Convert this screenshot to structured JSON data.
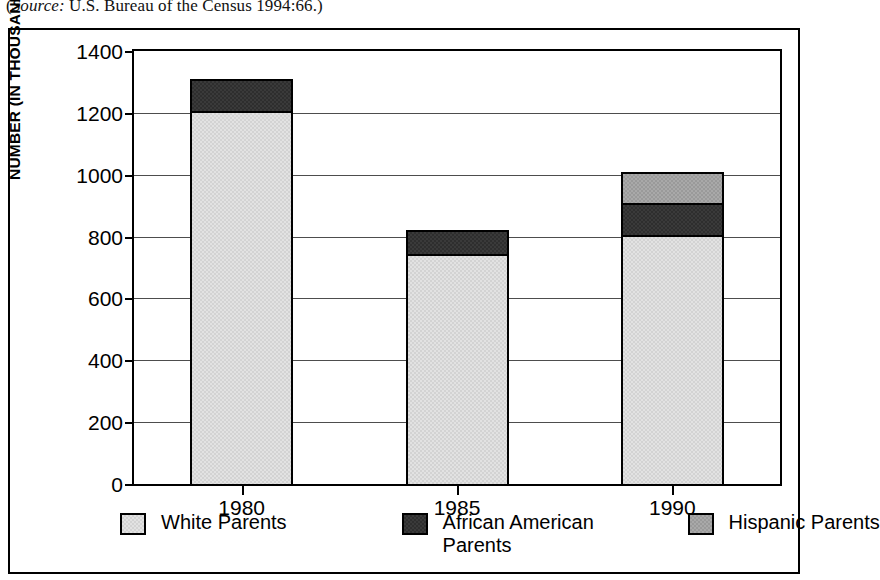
{
  "source_note": {
    "prefix": "(",
    "italic": "Source:",
    "text": " U.S. Bureau of the Census 1994:66.)"
  },
  "chart_data": {
    "type": "bar",
    "stacked": true,
    "title": "",
    "xlabel": "",
    "ylabel": "NUMBER (IN THOUSANDS)",
    "categories": [
      "1980",
      "1985",
      "1990"
    ],
    "ylim": [
      0,
      1400
    ],
    "ytick_step": 200,
    "yticks": [
      "1400",
      "1200",
      "1000",
      "800",
      "600",
      "400",
      "200",
      "0"
    ],
    "grid": true,
    "legend_position": "bottom",
    "series": [
      {
        "name": "White Parents",
        "color": "#e2e2e2",
        "values": [
          1205,
          745,
          805
        ]
      },
      {
        "name": "African American Parents",
        "color": "#3a3a3a",
        "values": [
          105,
          75,
          105
        ]
      },
      {
        "name": "Hispanic Parents",
        "color": "#a9a9a9",
        "values": [
          0,
          0,
          100
        ]
      }
    ],
    "totals": [
      1310,
      820,
      1010
    ]
  },
  "legend": [
    {
      "label": "White Parents",
      "key": "white-parents"
    },
    {
      "label": "African American Parents",
      "key": "african-american-parents"
    },
    {
      "label": "Hispanic Parents",
      "key": "hispanic-parents"
    }
  ]
}
